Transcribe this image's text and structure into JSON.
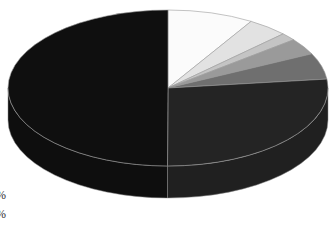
{
  "chart_data": {
    "type": "pie",
    "style": "3d",
    "title": "",
    "categories": [
      "Slice A",
      "Slice B",
      "Slice C",
      "Slice D",
      "Slice E",
      "Slice F",
      "Slice G"
    ],
    "values": [
      8.7,
      4.1,
      1.6,
      3.4,
      5.4,
      26.9,
      50.0
    ],
    "colors": [
      "#fbfbfb",
      "#e2e2e2",
      "#c4c4c4",
      "#9a9a9a",
      "#6f6f6f",
      "#242424",
      "#0f0f0f"
    ],
    "start_angle_deg": -90,
    "direction": "clockwise",
    "legend": {
      "position": "left (cropped)",
      "visible_fragments": [
        "%",
        "%"
      ]
    }
  },
  "legend_fragments": [
    "%",
    "%"
  ]
}
